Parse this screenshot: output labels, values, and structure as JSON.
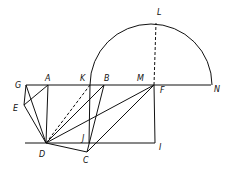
{
  "diagram": {
    "type": "geometric-construction",
    "stroke_color": "#111111",
    "background": "#ffffff",
    "points": {
      "G": {
        "x": 26,
        "y": 85
      },
      "A": {
        "x": 48,
        "y": 85
      },
      "K": {
        "x": 90,
        "y": 85
      },
      "B": {
        "x": 104,
        "y": 85
      },
      "M": {
        "x": 150,
        "y": 85
      },
      "F": {
        "x": 154,
        "y": 85
      },
      "N": {
        "x": 211,
        "y": 85
      },
      "L": {
        "x": 156,
        "y": 23
      },
      "E": {
        "x": 24,
        "y": 105
      },
      "D": {
        "x": 46,
        "y": 143
      },
      "J": {
        "x": 89,
        "y": 143
      },
      "C": {
        "x": 87,
        "y": 152
      },
      "I": {
        "x": 155,
        "y": 143
      }
    },
    "labels": [
      {
        "id": "L",
        "text": "L",
        "x": 157,
        "y": 15
      },
      {
        "id": "G",
        "text": "G",
        "x": 15,
        "y": 88
      },
      {
        "id": "A",
        "text": "A",
        "x": 45,
        "y": 81
      },
      {
        "id": "K",
        "text": "K",
        "x": 80,
        "y": 81
      },
      {
        "id": "B",
        "text": "B",
        "x": 104,
        "y": 81
      },
      {
        "id": "M",
        "text": "M",
        "x": 137,
        "y": 81
      },
      {
        "id": "F",
        "text": "F",
        "x": 160,
        "y": 93
      },
      {
        "id": "N",
        "text": "N",
        "x": 214,
        "y": 92
      },
      {
        "id": "E",
        "text": "E",
        "x": 13,
        "y": 111
      },
      {
        "id": "J",
        "text": "J",
        "x": 82,
        "y": 141
      },
      {
        "id": "D",
        "text": "D",
        "x": 39,
        "y": 157
      },
      {
        "id": "C",
        "text": "C",
        "x": 83,
        "y": 163
      },
      {
        "id": "I",
        "text": "I",
        "x": 159,
        "y": 150
      }
    ],
    "solid_segments": [
      [
        "G",
        "N"
      ],
      [
        "G",
        "E"
      ],
      [
        "E",
        "D"
      ],
      [
        "G",
        "D"
      ],
      [
        "E",
        "A"
      ],
      [
        "A",
        "D"
      ],
      [
        "D",
        "B"
      ],
      [
        "D",
        "F"
      ],
      [
        "D",
        "C"
      ],
      [
        "C",
        "B"
      ],
      [
        "C",
        "F"
      ],
      [
        "F",
        "I"
      ],
      [
        "K",
        "J"
      ]
    ],
    "dashed_segments": [
      [
        "D",
        "K"
      ],
      [
        "F",
        "L"
      ]
    ],
    "baseline": {
      "x1": 25,
      "y1": 143,
      "x2": 155,
      "y2": 143
    },
    "semicircle": {
      "cx": 151,
      "cy": 85,
      "r": 61
    }
  }
}
